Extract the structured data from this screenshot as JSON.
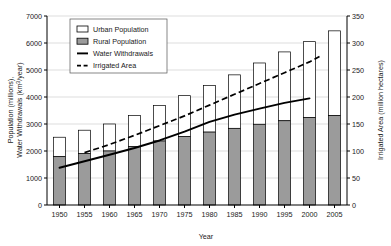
{
  "chart_data": {
    "type": "bar",
    "title": "",
    "subtitle": "",
    "xlabel": "Year",
    "ylabel": "Population (millions), Water Withdrawals (km3/year)",
    "ylabel_left_line1": "Population (millions),",
    "ylabel_left_line2_a": "Water Withdrawals (km",
    "ylabel_left_line2_sup": "3",
    "ylabel_left_line2_b": "/year)",
    "ylabel_right": "Irrigated Area (million hectares)",
    "categories": [
      "1950",
      "1955",
      "1960",
      "1965",
      "1970",
      "1975",
      "1980",
      "1985",
      "1990",
      "1995",
      "2000",
      "2005"
    ],
    "grid": true,
    "legend_position": "top-left",
    "ylim": [
      0,
      7000
    ],
    "yticks": [
      0,
      1000,
      2000,
      3000,
      4000,
      5000,
      6000,
      7000
    ],
    "ylim_right": [
      0,
      350
    ],
    "yticks_right": [
      0,
      50,
      100,
      150,
      200,
      250,
      300,
      350
    ],
    "series": [
      {
        "name": "Rural Population",
        "type": "bar-segment",
        "axis": "left",
        "color": "#9b9b9b",
        "values": [
          1790,
          1910,
          2000,
          2160,
          2370,
          2540,
          2700,
          2840,
          2990,
          3120,
          3240,
          3310
        ]
      },
      {
        "name": "Urban Population",
        "type": "bar-segment",
        "axis": "left",
        "color": "#ffffff",
        "values": [
          720,
          860,
          1000,
          1160,
          1310,
          1510,
          1730,
          1980,
          2270,
          2550,
          2810,
          3140
        ]
      },
      {
        "name": "Water Withdrawals",
        "type": "line",
        "axis": "left",
        "color": "#000000",
        "style": "solid",
        "x": [
          "1950",
          "1955",
          "1960",
          "1965",
          "1970",
          "1975",
          "1980",
          "1985",
          "1990",
          "1995",
          "2000"
        ],
        "values": [
          1380,
          1620,
          1860,
          2110,
          2390,
          2720,
          3080,
          3350,
          3570,
          3780,
          3950
        ]
      },
      {
        "name": "Irrigated Area",
        "type": "line",
        "axis": "right",
        "color": "#000000",
        "style": "dashed",
        "x": [
          "1955",
          "1960",
          "1965",
          "1970",
          "1975",
          "1980",
          "1985",
          "1990",
          "1995",
          "2000",
          "2002"
        ],
        "values": [
          97,
          112,
          129,
          147,
          165,
          185,
          205,
          225,
          245,
          265,
          275
        ]
      }
    ],
    "bar_totals": [
      2510,
      2770,
      3000,
      3320,
      3680,
      4050,
      4430,
      4820,
      5260,
      5670,
      6050,
      6450
    ]
  },
  "legend": {
    "items": [
      {
        "label": "Urban Population",
        "symbol": "open-rect"
      },
      {
        "label": "Rural Population",
        "symbol": "filled-rect"
      },
      {
        "label": "Water Withdrawals",
        "symbol": "solid-line"
      },
      {
        "label": "Irrigated Area",
        "symbol": "dashed-line"
      }
    ]
  },
  "colors": {
    "rural_fill": "#9b9b9b",
    "urban_fill": "#ffffff",
    "line": "#000000",
    "axis": "#000000",
    "grid": "#c8c8c8"
  }
}
